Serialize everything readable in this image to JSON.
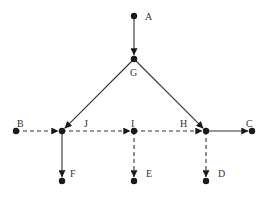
{
  "diagram": {
    "type": "directed-graph",
    "colors": {
      "node": "#1a1a1a",
      "edge": "#333333",
      "label": "#333333",
      "background": "#ffffff"
    },
    "nodes": [
      {
        "id": "A",
        "label": "A",
        "x": 134,
        "y": 16,
        "lx": 145,
        "ly": 20
      },
      {
        "id": "G",
        "label": "G",
        "x": 134,
        "y": 59,
        "lx": 130,
        "ly": 76
      },
      {
        "id": "B",
        "label": "B",
        "x": 16,
        "y": 131,
        "lx": 17,
        "ly": 127
      },
      {
        "id": "J",
        "label": "J",
        "x": 62,
        "y": 131,
        "lx": 84,
        "ly": 127
      },
      {
        "id": "I",
        "label": "I",
        "x": 134,
        "y": 131,
        "lx": 131,
        "ly": 127
      },
      {
        "id": "H",
        "label": "H",
        "x": 206,
        "y": 131,
        "lx": 180,
        "ly": 127
      },
      {
        "id": "C",
        "label": "C",
        "x": 252,
        "y": 131,
        "lx": 246,
        "ly": 127
      },
      {
        "id": "F",
        "label": "F",
        "x": 62,
        "y": 181,
        "lx": 70,
        "ly": 177
      },
      {
        "id": "E",
        "label": "E",
        "x": 134,
        "y": 181,
        "lx": 146,
        "ly": 177
      },
      {
        "id": "D",
        "label": "D",
        "x": 206,
        "y": 181,
        "lx": 218,
        "ly": 177
      }
    ],
    "edges": [
      {
        "from": "A",
        "to": "G",
        "style": "solid"
      },
      {
        "from": "G",
        "to": "J",
        "style": "solid"
      },
      {
        "from": "G",
        "to": "H",
        "style": "solid"
      },
      {
        "from": "B",
        "to": "J",
        "style": "dashed"
      },
      {
        "from": "J",
        "to": "I",
        "style": "dashed"
      },
      {
        "from": "I",
        "to": "H",
        "style": "dashed"
      },
      {
        "from": "H",
        "to": "C",
        "style": "solid"
      },
      {
        "from": "J",
        "to": "F",
        "style": "solid"
      },
      {
        "from": "I",
        "to": "E",
        "style": "dashed"
      },
      {
        "from": "H",
        "to": "D",
        "style": "dashed"
      }
    ]
  }
}
